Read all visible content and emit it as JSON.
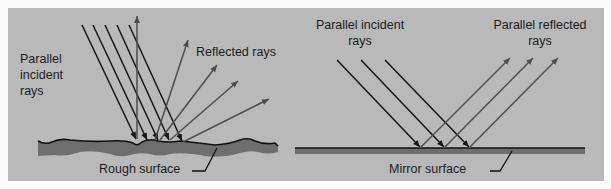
{
  "colors": {
    "background": "#b9b9b9",
    "page": "#fbfbfb",
    "incident_ray": "#151515",
    "reflected_ray": "#4e4e4e",
    "surface_fill": "#6e6e6e",
    "surface_line": "#111111"
  },
  "rough_panel": {
    "incident_label": [
      "Parallel",
      "incident",
      "rays"
    ],
    "reflected_label": "Reflected rays",
    "surface_label": "Rough surface",
    "incident_rays": [
      {
        "x1": 82,
        "y1": 25,
        "x2": 136,
        "y2": 139
      },
      {
        "x1": 93,
        "y1": 25,
        "x2": 147,
        "y2": 140
      },
      {
        "x1": 105,
        "y1": 25,
        "x2": 158,
        "y2": 140
      },
      {
        "x1": 117,
        "y1": 25,
        "x2": 169,
        "y2": 140
      },
      {
        "x1": 129,
        "y1": 25,
        "x2": 182,
        "y2": 141
      }
    ],
    "reflected_rays": [
      {
        "x1": 137,
        "y1": 139,
        "x2": 137,
        "y2": 16
      },
      {
        "x1": 155,
        "y1": 140,
        "x2": 188,
        "y2": 40
      },
      {
        "x1": 160,
        "y1": 140,
        "x2": 217,
        "y2": 65
      },
      {
        "x1": 170,
        "y1": 140,
        "x2": 238,
        "y2": 81
      },
      {
        "x1": 183,
        "y1": 142,
        "x2": 269,
        "y2": 99
      }
    ]
  },
  "mirror_panel": {
    "incident_label": [
      "Parallel incident",
      "rays"
    ],
    "reflected_label": [
      "Parallel reflected",
      "rays"
    ],
    "surface_label": "Mirror surface",
    "incident_rays": [
      {
        "x1": 337,
        "y1": 60,
        "x2": 420,
        "y2": 147
      },
      {
        "x1": 361,
        "y1": 60,
        "x2": 444,
        "y2": 147
      },
      {
        "x1": 385,
        "y1": 60,
        "x2": 469,
        "y2": 147
      }
    ],
    "reflected_rays": [
      {
        "x1": 420,
        "y1": 148,
        "x2": 510,
        "y2": 58
      },
      {
        "x1": 444,
        "y1": 148,
        "x2": 533,
        "y2": 58
      },
      {
        "x1": 469,
        "y1": 148,
        "x2": 558,
        "y2": 58
      }
    ]
  }
}
